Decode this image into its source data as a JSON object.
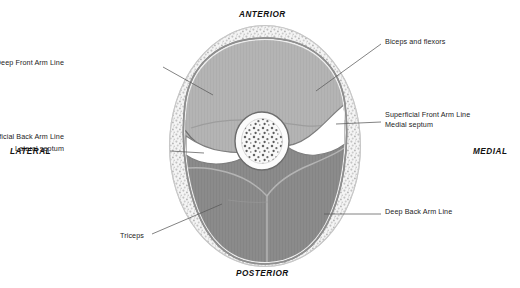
{
  "figure": {
    "title_alt": "Cross-section of the upper arm",
    "background_color": "#ffffff",
    "line_color": "#555555",
    "text_color": "#1c1c1c"
  },
  "orientation_labels": [
    {
      "name": "anterior",
      "text": "ANTERIOR",
      "x": 232,
      "y": 11
    },
    {
      "name": "posterior",
      "text": "POSTERIOR",
      "x": 230,
      "y": 269
    },
    {
      "name": "lateral",
      "text": "LATERAL",
      "x": 8,
      "y": 145
    },
    {
      "name": "medial",
      "text": "MEDIAL",
      "x": 468,
      "y": 145
    }
  ],
  "callouts": [
    {
      "name": "deep-front-arm-line",
      "text": "Deep Front Arm Line",
      "align": "right",
      "x": 64,
      "y": 62
    },
    {
      "name": "superficial-back-arm-line",
      "text": "Superficial Back Arm Line",
      "align": "right",
      "x": 55,
      "y": 136
    },
    {
      "name": "lateral-septum",
      "text": "Lateral septum",
      "align": "right",
      "x": 93,
      "y": 148
    },
    {
      "name": "triceps",
      "text": "Triceps",
      "align": "left",
      "x": 120,
      "y": 235
    },
    {
      "name": "biceps-and-flexors",
      "text": "Biceps and flexors",
      "align": "left",
      "x": 385,
      "y": 40
    },
    {
      "name": "superficial-front-arm-line",
      "text": "Superficial Front Arm Line",
      "align": "left",
      "x": 385,
      "y": 113
    },
    {
      "name": "medial-septum",
      "text": "Medial septum",
      "align": "left",
      "x": 385,
      "y": 123
    },
    {
      "name": "deep-back-arm-line",
      "text": "Deep Back Arm Line",
      "align": "left",
      "x": 385,
      "y": 210
    }
  ],
  "anatomy": {
    "skin_outline_color": "#b9b9b9",
    "fat_layer_color": "#f2f2f2",
    "fat_stipple_color": "#b0b0b0",
    "fascia_color": "#7d7d7d",
    "anterior_compartment_color": "#b3b3b3",
    "posterior_compartment_color": "#8a8a8a",
    "bone_color": "#f7f7f7",
    "bone_marrow_speckle_color": "#5d5d5d",
    "septum_color": "#ffffff",
    "structures": [
      {
        "name": "subcutaneous-fat-ring",
        "label": "subcutaneous fat"
      },
      {
        "name": "deep-fascia-ring",
        "label": "deep fascia"
      },
      {
        "name": "anterior-compartment",
        "label": "biceps and flexors"
      },
      {
        "name": "posterior-compartment",
        "label": "triceps"
      },
      {
        "name": "humerus",
        "label": "humerus"
      },
      {
        "name": "medial-septum",
        "label": "medial septum"
      },
      {
        "name": "lateral-septum",
        "label": "lateral septum"
      }
    ]
  }
}
